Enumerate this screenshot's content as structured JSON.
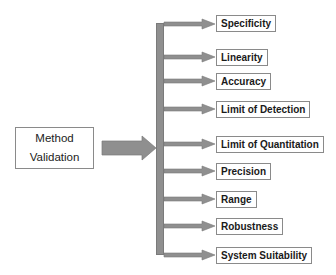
{
  "diagram": {
    "source": {
      "line1": "Method",
      "line2": "Validation"
    },
    "targets": [
      {
        "label": "Specificity",
        "top": 15
      },
      {
        "label": "Linearity",
        "top": 49
      },
      {
        "label": "Accuracy",
        "top": 73
      },
      {
        "label": "Limit of Detection",
        "top": 101
      },
      {
        "label": "Limit of Quantitation",
        "top": 136
      },
      {
        "label": "Precision",
        "top": 163
      },
      {
        "label": "Range",
        "top": 191
      },
      {
        "label": "Robustness",
        "top": 218
      },
      {
        "label": "System Suitability",
        "top": 247
      }
    ],
    "colors": {
      "arrow": "#8f8f8f",
      "border": "#8a8a8a",
      "text": "#1a1a1a"
    }
  }
}
